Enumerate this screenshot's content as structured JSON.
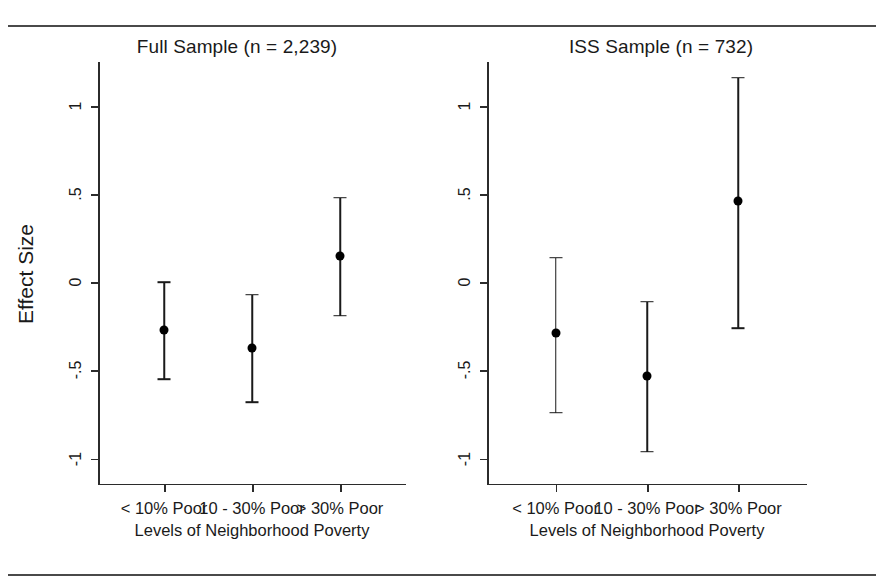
{
  "chart_data": {
    "type": "scatter",
    "title": "",
    "xlabel": "Levels of Neighborhood Poverty",
    "ylabel": "Effect Size",
    "ylim": [
      -1.15,
      1.25
    ],
    "yticks": [
      1,
      0.5,
      0,
      -0.5,
      -1
    ],
    "ytick_labels": [
      "1",
      ".5",
      "0",
      "-.5",
      "-1"
    ],
    "grid": false,
    "legend": "none",
    "categories": [
      "< 10% Poor",
      "10 - 30% Poor",
      "> 30% Poor"
    ],
    "panels": [
      {
        "title": "Full Sample (n = 2,239)",
        "points": [
          {
            "category": "< 10% Poor",
            "estimate": -0.27,
            "ci_low": -0.55,
            "ci_high": 0.0
          },
          {
            "category": "10 - 30% Poor",
            "estimate": -0.37,
            "ci_low": -0.68,
            "ci_high": -0.07
          },
          {
            "category": "> 30% Poor",
            "estimate": 0.15,
            "ci_low": -0.19,
            "ci_high": 0.48
          }
        ]
      },
      {
        "title": "ISS Sample (n = 732)",
        "points": [
          {
            "category": "< 10% Poor",
            "estimate": -0.29,
            "ci_low": -0.74,
            "ci_high": 0.14
          },
          {
            "category": "10 - 30% Poor",
            "estimate": -0.53,
            "ci_low": -0.96,
            "ci_high": -0.11
          },
          {
            "category": "> 30% Poor",
            "estimate": 0.46,
            "ci_low": -0.26,
            "ci_high": 1.16
          }
        ]
      }
    ]
  },
  "colors": {
    "marker": "#000000",
    "axis": "#2b2b2b",
    "rule": "#4a4a4a",
    "background": "#ffffff"
  }
}
